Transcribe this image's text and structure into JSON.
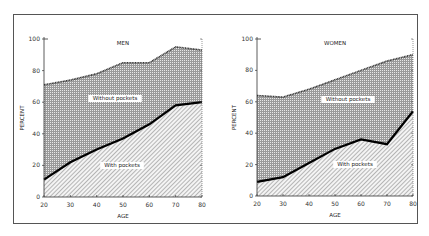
{
  "chart_data": [
    {
      "type": "area",
      "title": "MEN",
      "xlabel": "AGE",
      "ylabel": "PERCENT",
      "x": [
        20,
        30,
        40,
        50,
        60,
        70,
        80
      ],
      "ylim": [
        0,
        100
      ],
      "yticks": [
        0,
        20,
        40,
        60,
        80,
        100
      ],
      "series": [
        {
          "name": "Without pockets",
          "values": [
            71,
            74,
            78,
            85,
            85,
            95,
            93
          ]
        },
        {
          "name": "With pockets",
          "values": [
            11,
            22,
            30,
            37,
            46,
            58,
            60
          ]
        }
      ],
      "annotations": [
        "Without pockets",
        "With pockets"
      ]
    },
    {
      "type": "area",
      "title": "WOMEN",
      "xlabel": "AGE",
      "ylabel": "PERCENT",
      "x": [
        20,
        30,
        40,
        50,
        60,
        70,
        80
      ],
      "ylim": [
        0,
        100
      ],
      "yticks": [
        0,
        20,
        40,
        60,
        80,
        100
      ],
      "series": [
        {
          "name": "Without pockets",
          "values": [
            64,
            63,
            68,
            74,
            80,
            86,
            90
          ]
        },
        {
          "name": "With pockets",
          "values": [
            9,
            12,
            21,
            30,
            36,
            33,
            54
          ]
        }
      ],
      "annotations": [
        "Without pockets",
        "With pockets"
      ]
    }
  ],
  "labels": {
    "men_title": "MEN",
    "women_title": "WOMEN",
    "xlabel": "AGE",
    "ylabel": "PERCENT",
    "without": "Without pockets",
    "with": "With pockets"
  }
}
